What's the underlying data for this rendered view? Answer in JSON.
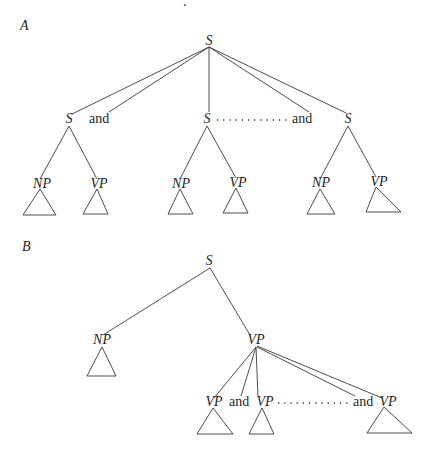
{
  "figure": {
    "speck": ".",
    "panel_a": {
      "label": "A",
      "root": "S",
      "conjuncts": [
        {
          "node": "S",
          "children": [
            "NP",
            "VP"
          ]
        },
        {
          "node": "S",
          "children": [
            "NP",
            "VP"
          ]
        },
        {
          "node": "S",
          "children": [
            "NP",
            "VP"
          ]
        }
      ],
      "conjunction_1": "and",
      "conjunction_2": "and",
      "ellipsis": "..........."
    },
    "panel_b": {
      "label": "B",
      "root": "S",
      "subject": "NP",
      "predicate": "VP",
      "conjuncts": [
        "VP",
        "VP",
        "VP"
      ],
      "conjunction_1": "and",
      "conjunction_2": "and",
      "ellipsis": ".........."
    }
  }
}
